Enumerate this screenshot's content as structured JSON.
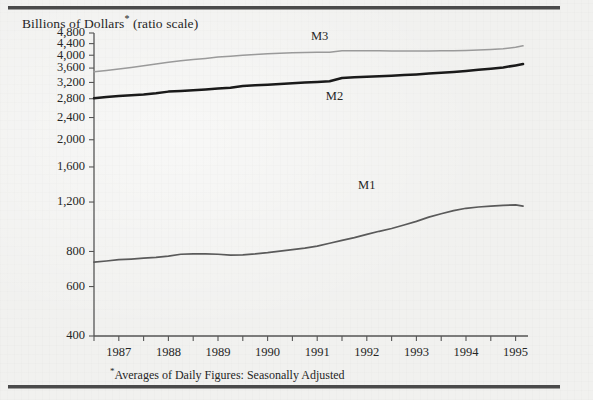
{
  "title": {
    "main": "Billions of Dollars",
    "marker": "*",
    "suffix": " (ratio scale)"
  },
  "footnote": {
    "marker": "*",
    "text": "Averages of Daily Figures: Seasonally Adjusted"
  },
  "colors": {
    "background": "#f1f1ef",
    "rule": "#4a4a4a",
    "axis": "#555555",
    "text": "#262626",
    "m1": "#5a5a5a",
    "m2": "#1a1a1a",
    "m3": "#9a9a9a"
  },
  "chart_data": {
    "type": "line",
    "title": "Billions of Dollars* (ratio scale)",
    "xlabel": "",
    "ylabel": "Billions of Dollars",
    "scale": "log",
    "grid": false,
    "legend_position": "inline-labels",
    "xlim": [
      1986.5,
      1995.25
    ],
    "ylim": [
      400,
      4800
    ],
    "ytick_labels": [
      "4,800",
      "4,400",
      "4,000",
      "3,600",
      "3,200",
      "2,800",
      "2,400",
      "2,000",
      "1,600",
      "1,200",
      "800",
      "600",
      "400"
    ],
    "ytick_values": [
      4800,
      4400,
      4000,
      3600,
      3200,
      2800,
      2400,
      2000,
      1600,
      1200,
      800,
      600,
      400
    ],
    "xtick_labels": [
      "1987",
      "1988",
      "1989",
      "1990",
      "1991",
      "1992",
      "1993",
      "1994",
      "1995"
    ],
    "xtick_values": [
      1987,
      1988,
      1989,
      1990,
      1991,
      1992,
      1993,
      1994,
      1995
    ],
    "minor_tick_interval": 0.5,
    "series": [
      {
        "name": "M1",
        "color": "#5a5a5a",
        "label_x": 1992.0,
        "label_y": 1330,
        "x": [
          1986.5,
          1986.75,
          1987.0,
          1987.25,
          1987.5,
          1987.75,
          1988.0,
          1988.25,
          1988.5,
          1988.75,
          1989.0,
          1989.25,
          1989.5,
          1989.75,
          1990.0,
          1990.25,
          1990.5,
          1990.75,
          1991.0,
          1991.25,
          1991.5,
          1991.75,
          1992.0,
          1992.25,
          1992.5,
          1992.75,
          1993.0,
          1993.25,
          1993.5,
          1993.75,
          1994.0,
          1994.25,
          1994.5,
          1994.75,
          1995.0,
          1995.15
        ],
        "values": [
          733,
          740,
          748,
          752,
          757,
          762,
          770,
          782,
          784,
          784,
          782,
          776,
          778,
          784,
          792,
          802,
          812,
          822,
          836,
          856,
          876,
          896,
          920,
          944,
          966,
          994,
          1024,
          1060,
          1090,
          1118,
          1140,
          1152,
          1160,
          1168,
          1172,
          1160
        ]
      },
      {
        "name": "M2",
        "color": "#1a1a1a",
        "label_x": 1991.35,
        "label_y": 2760,
        "x": [
          1986.5,
          1986.75,
          1987.0,
          1987.25,
          1987.5,
          1987.75,
          1988.0,
          1988.25,
          1988.5,
          1988.75,
          1989.0,
          1989.25,
          1989.5,
          1989.75,
          1990.0,
          1990.25,
          1990.5,
          1990.75,
          1991.0,
          1991.25,
          1991.5,
          1991.75,
          1992.0,
          1992.25,
          1992.5,
          1992.75,
          1993.0,
          1993.25,
          1993.5,
          1993.75,
          1994.0,
          1994.25,
          1994.5,
          1994.75,
          1995.0,
          1995.15
        ],
        "values": [
          2810,
          2840,
          2866,
          2880,
          2900,
          2930,
          2968,
          2984,
          3000,
          3020,
          3046,
          3066,
          3110,
          3128,
          3142,
          3158,
          3176,
          3196,
          3214,
          3230,
          3320,
          3338,
          3350,
          3364,
          3378,
          3398,
          3418,
          3440,
          3462,
          3488,
          3516,
          3548,
          3580,
          3620,
          3680,
          3720
        ]
      },
      {
        "name": "M3",
        "color": "#9a9a9a",
        "label_x": 1991.05,
        "label_y": 4520,
        "x": [
          1986.5,
          1986.75,
          1987.0,
          1987.25,
          1987.5,
          1987.75,
          1988.0,
          1988.25,
          1988.5,
          1988.75,
          1989.0,
          1989.25,
          1989.5,
          1989.75,
          1990.0,
          1990.25,
          1990.5,
          1990.75,
          1991.0,
          1991.25,
          1991.5,
          1991.75,
          1992.0,
          1992.25,
          1992.5,
          1992.75,
          1993.0,
          1993.25,
          1993.5,
          1993.75,
          1994.0,
          1994.25,
          1994.5,
          1994.75,
          1995.0,
          1995.15
        ],
        "values": [
          3490,
          3530,
          3576,
          3620,
          3670,
          3720,
          3776,
          3820,
          3860,
          3898,
          3940,
          3968,
          4000,
          4026,
          4050,
          4066,
          4080,
          4090,
          4096,
          4098,
          4150,
          4152,
          4150,
          4146,
          4144,
          4142,
          4140,
          4142,
          4146,
          4152,
          4160,
          4172,
          4190,
          4216,
          4270,
          4320
        ]
      }
    ]
  }
}
